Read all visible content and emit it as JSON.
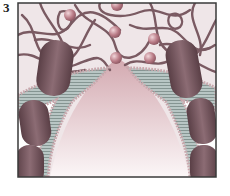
{
  "figure": {
    "panel_label": "3",
    "colors": {
      "frame": "#3a3a3a",
      "background_top": "#efe6e8",
      "filament": "#7a5a62",
      "vesicle": "#b97b86",
      "bilayer_core": "#b8c6c4",
      "lipid_head": "#c9a9ae",
      "protein": "#6e5058",
      "lumen_top": "#d8b4ba",
      "lumen_bottom": "#fbf6f7"
    }
  }
}
